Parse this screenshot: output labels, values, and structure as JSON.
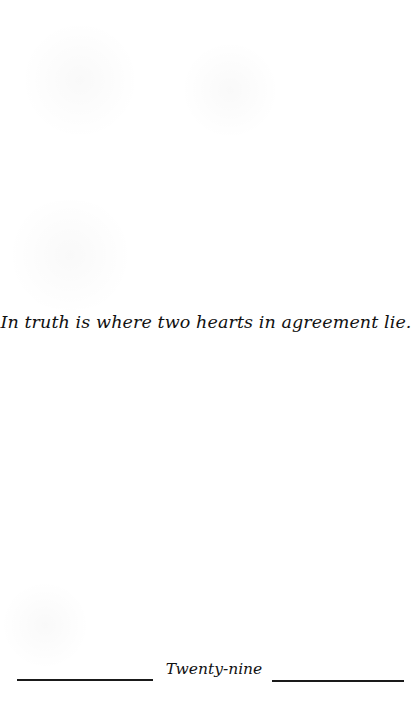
{
  "page": {
    "background_color": "#ffffff",
    "text_color": "#111111"
  },
  "quote": {
    "text": "In truth is where two hearts in agreement lie."
  },
  "footer": {
    "page_label": "Twenty-nine"
  }
}
